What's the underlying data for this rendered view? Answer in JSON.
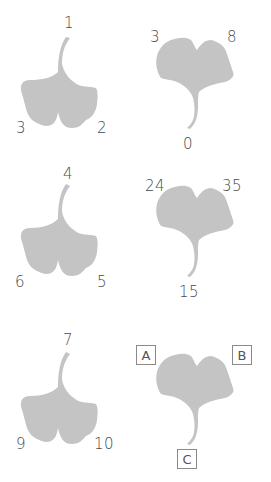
{
  "colors": {
    "leaf": "#c4c4c4",
    "label": "#4a4a4a",
    "box_border": "#8a8a8a"
  },
  "leaves": [
    {
      "orientation": "stem-up",
      "labels": {
        "stem": "1",
        "left": "3",
        "right": "2"
      }
    },
    {
      "orientation": "stem-down",
      "labels": {
        "left": "3",
        "right": "8",
        "stem": "0"
      }
    },
    {
      "orientation": "stem-up",
      "labels": {
        "stem": "4",
        "left": "6",
        "right": "5"
      }
    },
    {
      "orientation": "stem-down",
      "labels": {
        "left": "24",
        "right": "35",
        "stem": "15"
      }
    },
    {
      "orientation": "stem-up",
      "labels": {
        "stem": "7",
        "left": "9",
        "right": "10"
      }
    },
    {
      "orientation": "stem-down",
      "labels": {
        "left": "A",
        "right": "B",
        "stem": "C"
      },
      "boxed": true
    }
  ]
}
